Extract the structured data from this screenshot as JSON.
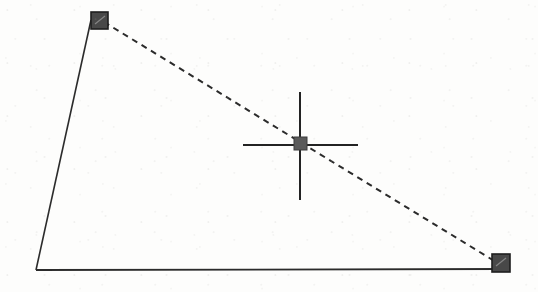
{
  "canvas": {
    "name": "handle-drag-canvas",
    "width": 538,
    "height": 292,
    "background_color": "#fdfdfc",
    "ink_color": "#2b2b2b",
    "handle_fill_color": "#484848",
    "handle_border_color": "#1e1e1e",
    "center_marker_color": "#5a5a5a",
    "crosshair_color": "#232323"
  },
  "shape": {
    "label": "polygon-outline",
    "solid_edges": [
      {
        "id": "left-edge",
        "x1": 91,
        "y1": 20,
        "x2": 36,
        "y2": 270,
        "stroke_width": 1.6,
        "style": "solid"
      },
      {
        "id": "bottom-edge",
        "x1": 36,
        "y1": 270,
        "x2": 501,
        "y2": 269,
        "stroke_width": 1.8,
        "style": "solid"
      }
    ],
    "dashed_edges": [
      {
        "id": "hypotenuse",
        "x1": 104,
        "y1": 22,
        "x2": 496,
        "y2": 262,
        "stroke_width": 2.0,
        "style": "dashed",
        "dash_length": 6,
        "gap_length": 5
      }
    ]
  },
  "handles": [
    {
      "id": "vertex-handle-top-left",
      "label": "top-left vertex handle",
      "x": 91,
      "y": 12,
      "width": 17,
      "height": 17,
      "state": "selected"
    },
    {
      "id": "vertex-handle-bottom-right",
      "label": "bottom-right vertex handle",
      "x": 492,
      "y": 254,
      "width": 18,
      "height": 18,
      "state": "selected"
    }
  ],
  "center_marker": {
    "id": "midpoint-grip",
    "label": "midpoint drag grip",
    "x": 294,
    "y": 137,
    "width": 13,
    "height": 13
  },
  "crosshair": {
    "id": "cursor-crosshair",
    "label": "crosshair cursor",
    "center_x": 300,
    "center_y": 145,
    "vertical_top": 92,
    "vertical_bottom": 200,
    "horizontal_left": 243,
    "horizontal_right": 358,
    "stroke_width": 2.0
  }
}
